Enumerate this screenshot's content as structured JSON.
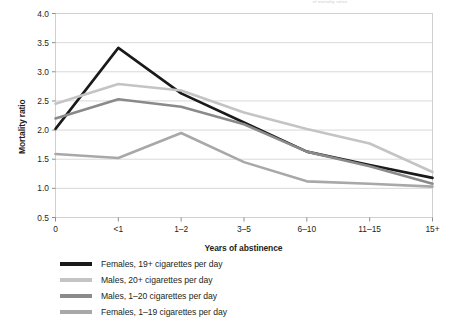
{
  "figure": {
    "top_fragment": "of mortality ratios"
  },
  "chart_data": {
    "type": "line",
    "title": "",
    "xlabel": "Years of abstinence",
    "ylabel": "Mortality ratio",
    "categories": [
      "0",
      "<1",
      "1–2",
      "3–5",
      "6–10",
      "11–15",
      "15+"
    ],
    "ylim": [
      0.5,
      4.0
    ],
    "yticks": [
      "0.5",
      "1.0",
      "1.5",
      "2.0",
      "2.5",
      "3.0",
      "3.5",
      "4.0"
    ],
    "ytick_values": [
      0.5,
      1.0,
      1.5,
      2.0,
      2.5,
      3.0,
      3.5,
      4.0
    ],
    "grid": true,
    "legend_position": "below",
    "series": [
      {
        "name": "Females, 19+ cigarettes per day",
        "color": "#1a1a1a",
        "values": [
          2.02,
          3.41,
          2.63,
          2.13,
          1.63,
          1.4,
          1.18
        ]
      },
      {
        "name": "Males, 20+ cigarettes per day",
        "color": "#c4c4c4",
        "values": [
          2.45,
          2.79,
          2.68,
          2.3,
          2.02,
          1.77,
          1.28
        ]
      },
      {
        "name": "Males, 1–20 cigarettes per day",
        "color": "#8a8a8a",
        "values": [
          2.2,
          2.53,
          2.4,
          2.1,
          1.63,
          1.38,
          1.08
        ]
      },
      {
        "name": "Females, 1–19 cigarettes per day",
        "color": "#a8a8a8",
        "values": [
          1.59,
          1.52,
          1.95,
          1.45,
          1.12,
          1.08,
          1.03
        ]
      }
    ]
  }
}
